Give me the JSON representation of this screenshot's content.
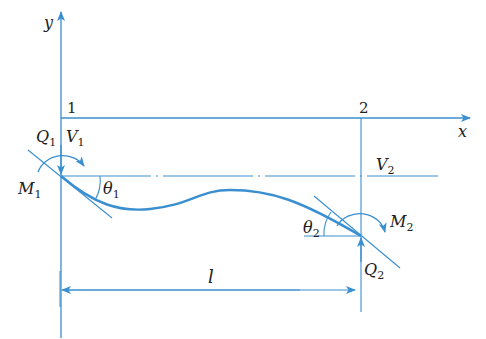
{
  "diagram": {
    "colors": {
      "line": "#3a8fd0",
      "text": "#222222",
      "background": "#ffffff"
    },
    "axes": {
      "x_label": "x",
      "y_label": "y"
    },
    "nodes": [
      {
        "id": "1",
        "label": "1"
      },
      {
        "id": "2",
        "label": "2"
      }
    ],
    "labels": {
      "Q1": {
        "main": "Q",
        "sub": "1"
      },
      "V1": {
        "main": "V",
        "sub": "1"
      },
      "M1": {
        "main": "M",
        "sub": "1"
      },
      "theta1": {
        "main": "θ",
        "sub": "1"
      },
      "V2": {
        "main": "V",
        "sub": "2"
      },
      "theta2": {
        "main": "θ",
        "sub": "2"
      },
      "M2": {
        "main": "M",
        "sub": "2"
      },
      "Q2": {
        "main": "Q",
        "sub": "2"
      }
    },
    "dimension": {
      "label": "l"
    }
  }
}
